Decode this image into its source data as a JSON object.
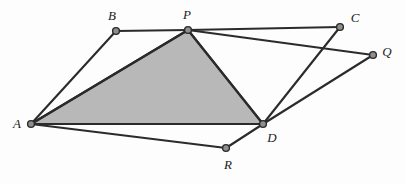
{
  "figure": {
    "width": 405,
    "height": 184,
    "background_color": "#fdfdfd"
  },
  "style": {
    "stroke_color": "#2b2b2b",
    "stroke_width": 2.1,
    "shade_fill": "#b8b8b8",
    "shade_stroke": "#2b2b2b",
    "vertex_fill": "#8e8e8e",
    "vertex_stroke": "#2b2b2b",
    "vertex_radius": 3.4,
    "label_color": "#1c1c1c",
    "label_font_size": 13
  },
  "points": [
    {
      "id": "A",
      "label": "A",
      "x": 31,
      "y": 124,
      "label_x": 17,
      "label_y": 123
    },
    {
      "id": "B",
      "label": "B",
      "x": 116,
      "y": 31,
      "label_x": 112,
      "label_y": 15
    },
    {
      "id": "P",
      "label": "P",
      "x": 188,
      "y": 30,
      "label_x": 187,
      "label_y": 14
    },
    {
      "id": "C",
      "label": "C",
      "x": 340,
      "y": 27,
      "label_x": 355,
      "label_y": 17
    },
    {
      "id": "Q",
      "label": "Q",
      "x": 373,
      "y": 55,
      "label_x": 387,
      "label_y": 51
    },
    {
      "id": "D",
      "label": "D",
      "x": 263,
      "y": 124,
      "label_x": 272,
      "label_y": 137
    },
    {
      "id": "R",
      "label": "R",
      "x": 226,
      "y": 148,
      "label_x": 228,
      "label_y": 164
    }
  ],
  "shaded_region": {
    "name": "triangle-APD",
    "vertices": [
      "A",
      "P",
      "D"
    ],
    "fill": "#b8b8b8"
  },
  "edges": [
    {
      "name": "edge-A-B",
      "from": "A",
      "to": "B"
    },
    {
      "name": "edge-B-P",
      "from": "B",
      "to": "P"
    },
    {
      "name": "edge-P-C",
      "from": "P",
      "to": "C"
    },
    {
      "name": "edge-P-Q",
      "from": "P",
      "to": "Q"
    },
    {
      "name": "edge-D-C",
      "from": "D",
      "to": "C"
    },
    {
      "name": "edge-D-Q",
      "from": "D",
      "to": "Q"
    },
    {
      "name": "edge-A-R",
      "from": "A",
      "to": "R"
    },
    {
      "name": "edge-R-D",
      "from": "R",
      "to": "D"
    },
    {
      "name": "edge-A-P",
      "from": "A",
      "to": "P"
    },
    {
      "name": "edge-P-D",
      "from": "P",
      "to": "D"
    },
    {
      "name": "edge-A-D",
      "from": "A",
      "to": "D"
    }
  ]
}
